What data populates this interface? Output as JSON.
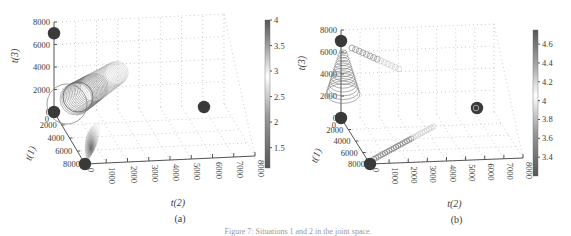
{
  "caption": "Figure 7: Situations 1 and 2 in the joint space.",
  "chart_data": [
    {
      "type": "scatter",
      "subplot_label": "(a)",
      "projection": "3d",
      "xlabel": "t(2)",
      "ylabel": "t(1)",
      "zlabel": "t(3)",
      "xlim": [
        0,
        8000
      ],
      "ylim": [
        0,
        8000
      ],
      "zlim": [
        0,
        8000
      ],
      "xticks": [
        "0",
        "1000",
        "2000",
        "3000",
        "4000",
        "5000",
        "6000",
        "7000",
        "8000"
      ],
      "yticks": [
        "0",
        "2000",
        "4000",
        "6000",
        "8000"
      ],
      "zticks": [
        "0",
        "2000",
        "4000",
        "6000",
        "8000"
      ],
      "grid": true,
      "colorbar": {
        "min": 1.1,
        "max": 4,
        "ticks": [
          "1.5",
          "2",
          "2.5",
          "3",
          "3.5",
          "4"
        ]
      },
      "anchor_points": [
        {
          "name": "origin",
          "t1": 0,
          "t2": 0,
          "t3": 0
        },
        {
          "name": "t3-anchor",
          "t1": 0,
          "t2": 0,
          "t3": 7000
        },
        {
          "name": "t1-anchor",
          "t1": 8000,
          "t2": 0,
          "t3": 0
        },
        {
          "name": "t2-anchor",
          "t1": 0,
          "t2": 7000,
          "t3": 0
        }
      ],
      "trajectories": [
        {
          "name": "large-ring-cluster",
          "description": "concentric rings near origin sweeping toward t(2)",
          "count": 30
        },
        {
          "name": "lower-fan",
          "description": "shaded fan toward t1-anchor",
          "count": 20
        }
      ]
    },
    {
      "type": "scatter",
      "subplot_label": "(b)",
      "projection": "3d",
      "xlabel": "t(2)",
      "ylabel": "t(1)",
      "zlabel": "t(3)",
      "xlim": [
        0,
        8000
      ],
      "ylim": [
        0,
        8000
      ],
      "zlim": [
        0,
        8000
      ],
      "xticks": [
        "0",
        "1000",
        "2000",
        "3000",
        "4000",
        "5000",
        "6000",
        "7000",
        "8000"
      ],
      "yticks": [
        "0",
        "2000",
        "4000",
        "6000",
        "8000"
      ],
      "zticks": [
        "0",
        "2000",
        "4000",
        "6000",
        "8000"
      ],
      "grid": true,
      "colorbar": {
        "min": 3.2,
        "max": 4.75,
        "ticks": [
          "3.4",
          "3.6",
          "3.8",
          "4",
          "4.2",
          "4.4",
          "4.6"
        ]
      },
      "anchor_points": [
        {
          "name": "origin",
          "t1": 0,
          "t2": 0,
          "t3": 0
        },
        {
          "name": "t3-anchor",
          "t1": 0,
          "t2": 0,
          "t3": 7000
        },
        {
          "name": "t1-anchor",
          "t1": 8000,
          "t2": 0,
          "t3": 0
        },
        {
          "name": "t2-anchor",
          "t1": 0,
          "t2": 7000,
          "t3": 0
        }
      ],
      "trajectories": [
        {
          "name": "vertical-cone",
          "description": "stacked rings below t3-anchor",
          "count": 14
        },
        {
          "name": "top-chain",
          "description": "small rings from t3-anchor toward t(2)",
          "count": 14
        },
        {
          "name": "bottom-chain",
          "description": "small rings from t1-anchor toward t(2)",
          "count": 28
        }
      ]
    }
  ]
}
